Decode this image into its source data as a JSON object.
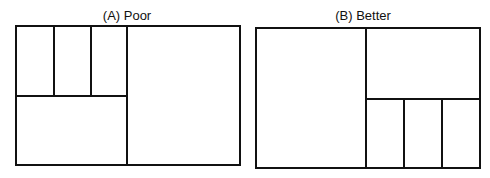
{
  "panels": [
    {
      "title": "(A) Poor",
      "title_pos": {
        "x": 127,
        "y": 8
      },
      "outer": {
        "x1": 16,
        "y1": 26,
        "x2": 240,
        "y2": 165
      },
      "lines": [
        {
          "x1": 127,
          "y1": 26,
          "x2": 127,
          "y2": 165
        },
        {
          "x1": 16,
          "y1": 96,
          "x2": 127,
          "y2": 96
        },
        {
          "x1": 54,
          "y1": 26,
          "x2": 54,
          "y2": 96
        },
        {
          "x1": 91,
          "y1": 26,
          "x2": 91,
          "y2": 96
        }
      ]
    },
    {
      "title": "(B) Better",
      "title_pos": {
        "x": 363,
        "y": 8
      },
      "outer": {
        "x1": 256,
        "y1": 28,
        "x2": 480,
        "y2": 168
      },
      "lines": [
        {
          "x1": 366,
          "y1": 28,
          "x2": 366,
          "y2": 168
        },
        {
          "x1": 366,
          "y1": 99,
          "x2": 480,
          "y2": 99
        },
        {
          "x1": 404,
          "y1": 99,
          "x2": 404,
          "y2": 168
        },
        {
          "x1": 442,
          "y1": 99,
          "x2": 442,
          "y2": 168
        }
      ]
    }
  ],
  "colors": {
    "stroke": "#111111",
    "background": "#ffffff"
  }
}
